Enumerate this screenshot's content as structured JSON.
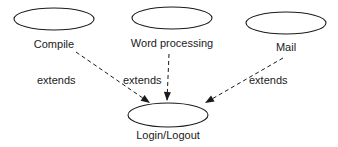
{
  "diagram": {
    "type": "use-case",
    "nodes": [
      {
        "id": "compile",
        "label": "Compile",
        "cx": 54,
        "cy": 19,
        "rx": 40,
        "ry": 11,
        "lx": 54,
        "ly": 48
      },
      {
        "id": "word",
        "label": "Word processing",
        "cx": 172,
        "cy": 18,
        "rx": 40,
        "ry": 11,
        "lx": 172,
        "ly": 47
      },
      {
        "id": "mail",
        "label": "Mail",
        "cx": 286,
        "cy": 23,
        "rx": 40,
        "ry": 11,
        "lx": 286,
        "ly": 51
      },
      {
        "id": "login",
        "label": "Login/Logout",
        "cx": 168,
        "cy": 115,
        "rx": 40,
        "ry": 12,
        "lx": 168,
        "ly": 139
      }
    ],
    "edges": [
      {
        "from": "compile",
        "to": "login",
        "label": "extends",
        "x1": 76,
        "y1": 52,
        "x2": 150,
        "y2": 103,
        "lx": 37,
        "ly": 84
      },
      {
        "from": "word",
        "to": "login",
        "label": "extends",
        "x1": 169,
        "y1": 54,
        "x2": 167,
        "y2": 101,
        "lx": 123,
        "ly": 84
      },
      {
        "from": "mail",
        "to": "login",
        "label": "extends",
        "x1": 283,
        "y1": 58,
        "x2": 205,
        "y2": 103,
        "lx": 249,
        "ly": 84
      }
    ],
    "line_color": "#1a1a1a"
  }
}
